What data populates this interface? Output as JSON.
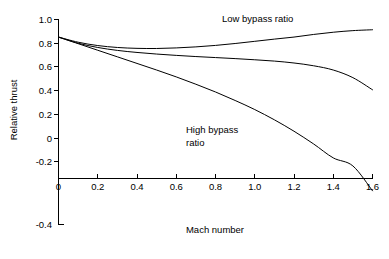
{
  "chart_data": {
    "type": "line",
    "title": "",
    "xlabel": "Mach number",
    "ylabel": "Relative thrust",
    "xlim": [
      0,
      1.6
    ],
    "ylim": [
      -0.4,
      1.0
    ],
    "xticks": [
      0,
      0.2,
      0.4,
      0.6,
      0.8,
      1.0,
      1.2,
      1.4,
      1.6
    ],
    "xticklabels": [
      "0",
      "0.2",
      "0.4",
      "0.6",
      "0.8",
      "1.0",
      "1.2",
      "1.4",
      "1.6"
    ],
    "yticks": [
      -0.4,
      -0.2,
      0,
      0.2,
      0.4,
      0.6,
      0.8,
      1.0
    ],
    "yticklabels": [
      "-0.4",
      "-0.2",
      "0",
      "0.2",
      "0.4",
      "0.6",
      "0.8",
      "1.0"
    ],
    "grid": false,
    "legend": "annotations",
    "line_color": "#000000",
    "background": "#ffffff",
    "x": [
      0,
      0.1,
      0.2,
      0.3,
      0.4,
      0.5,
      0.6,
      0.7,
      0.8,
      0.9,
      1.0,
      1.1,
      1.2,
      1.3,
      1.4,
      1.5,
      1.6
    ],
    "series": [
      {
        "name": "Low bypass ratio",
        "values": [
          0.88,
          0.845,
          0.822,
          0.809,
          0.803,
          0.802,
          0.806,
          0.813,
          0.823,
          0.836,
          0.851,
          0.866,
          0.88,
          0.898,
          0.913,
          0.924,
          0.93
        ]
      },
      {
        "name": "Medium bypass ratio",
        "values": [
          0.88,
          0.838,
          0.809,
          0.789,
          0.775,
          0.764,
          0.755,
          0.747,
          0.74,
          0.733,
          0.725,
          0.716,
          0.703,
          0.684,
          0.655,
          0.603,
          0.52
        ]
      },
      {
        "name": "High bypass ratio",
        "values": [
          0.88,
          0.835,
          0.79,
          0.745,
          0.7,
          0.655,
          0.608,
          0.558,
          0.505,
          0.447,
          0.385,
          0.315,
          0.237,
          0.15,
          0.055,
          0.0,
          -0.17
        ]
      }
    ],
    "annotations": [
      {
        "text": "Low bypass ratio",
        "lines": [
          "Low bypass ratio"
        ],
        "x": 0.95,
        "y": 0.975
      },
      {
        "text": "High bypass ratio",
        "lines": [
          "High bypass",
          "ratio"
        ],
        "x": 0.62,
        "y": 0.34
      }
    ]
  }
}
